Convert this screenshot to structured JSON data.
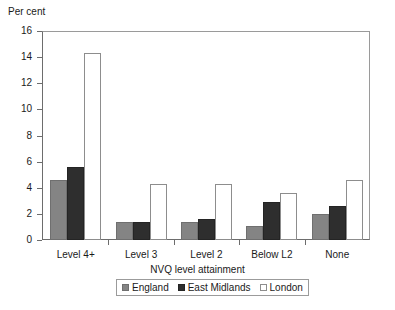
{
  "chart_data": {
    "type": "bar",
    "title": "",
    "subtitle": "",
    "ylabel": "Per cent",
    "xlabel": "NVQ level attainment",
    "categories": [
      "Level 4+",
      "Level 3",
      "Level 2",
      "Below L2",
      "None"
    ],
    "series": [
      {
        "name": "England",
        "color": "#848484",
        "values": [
          4.6,
          1.4,
          1.4,
          1.1,
          2.0
        ]
      },
      {
        "name": "East Midlands",
        "color": "#2e2e2e",
        "values": [
          5.6,
          1.4,
          1.6,
          2.9,
          2.6
        ]
      },
      {
        "name": "London",
        "color": "#ffffff",
        "values": [
          14.3,
          4.3,
          4.3,
          3.6,
          4.6
        ]
      }
    ],
    "ylim": [
      0,
      16
    ],
    "yticks": [
      0,
      2,
      4,
      6,
      8,
      10,
      12,
      14,
      16
    ],
    "ytick_labels": [
      "0",
      "2",
      "4",
      "6",
      "8",
      "10",
      "12",
      "14",
      "16"
    ],
    "grid": false,
    "legend_position": "bottom"
  },
  "legend": {
    "items": [
      {
        "label": "England",
        "swatch": "england-swatch"
      },
      {
        "label": "East Midlands",
        "swatch": "east-midlands-swatch"
      },
      {
        "label": "London",
        "swatch": "london-swatch"
      }
    ]
  }
}
